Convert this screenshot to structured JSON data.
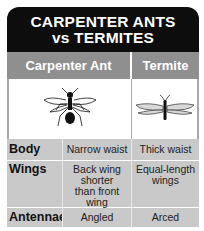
{
  "title": {
    "line1": "CARPENTER ANTS",
    "line2": "vs TERMITES"
  },
  "columns": [
    "Carpenter Ant",
    "Termite"
  ],
  "images": {
    "ant": "carpenter-ant-illustration",
    "termite": "termite-illustration"
  },
  "rows": [
    {
      "label": "Body",
      "ant": "Narrow waist",
      "termite": "Thick waist"
    },
    {
      "label": "Wings",
      "ant": "Back wing shorter than front wing",
      "termite": "Equal-length wings"
    },
    {
      "label": "Antennae",
      "ant": "Angled",
      "termite": "Arced"
    }
  ],
  "colors": {
    "title_bg": "#0d0d0d",
    "header_bg": "#8f8f8f",
    "cell_bg": "#c9c9c9"
  }
}
